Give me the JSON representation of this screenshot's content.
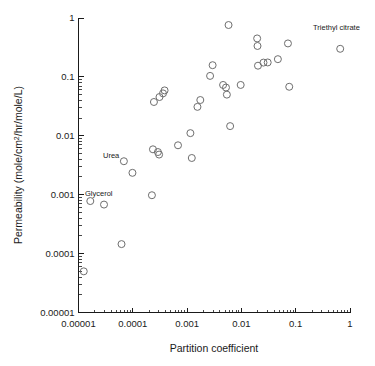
{
  "chart_data": {
    "type": "scatter",
    "title": "",
    "xlabel": "Partition coefficient",
    "ylabel": "Permeability (mole/cm2/hr/mole/L)",
    "ylabel_parts": {
      "pre": "Permeability (mole/cm",
      "sup": "2",
      "post": "/hr/mole/L)"
    },
    "xscale": "log",
    "yscale": "log",
    "xlim": [
      1e-05,
      1
    ],
    "ylim": [
      1e-05,
      1
    ],
    "grid": false,
    "legend": null,
    "xticks": [
      "0.00001",
      "0.0001",
      "0.001",
      "0.01",
      "0.1",
      "1"
    ],
    "xtick_values": [
      1e-05,
      0.0001,
      0.001,
      0.01,
      0.1,
      1
    ],
    "yticks": [
      "0.00001",
      "0.0001",
      "0.001",
      "0.01",
      "0.1",
      "1"
    ],
    "ytick_values": [
      1e-05,
      0.0001,
      0.001,
      0.01,
      0.1,
      1
    ],
    "marker": "open-circle",
    "marker_color": "#6e6e6e",
    "points": [
      {
        "x": 1.25e-05,
        "y": 5e-05,
        "label": null
      },
      {
        "x": 1.65e-05,
        "y": 0.00078,
        "label": "Glycerol"
      },
      {
        "x": 2.95e-05,
        "y": 0.00068,
        "label": null
      },
      {
        "x": 6.2e-05,
        "y": 0.000145,
        "label": null
      },
      {
        "x": 6.85e-05,
        "y": 0.0037,
        "label": "Urea"
      },
      {
        "x": 9.85e-05,
        "y": 0.00235,
        "label": null
      },
      {
        "x": 0.000225,
        "y": 0.00098,
        "label": null
      },
      {
        "x": 0.000235,
        "y": 0.0059,
        "label": null
      },
      {
        "x": 0.000245,
        "y": 0.0375,
        "label": null
      },
      {
        "x": 0.00029,
        "y": 0.0053,
        "label": null
      },
      {
        "x": 0.000305,
        "y": 0.0048,
        "label": null
      },
      {
        "x": 0.00031,
        "y": 0.0455,
        "label": null
      },
      {
        "x": 0.00036,
        "y": 0.0525,
        "label": null
      },
      {
        "x": 0.000385,
        "y": 0.059,
        "label": null
      },
      {
        "x": 0.00068,
        "y": 0.0069,
        "label": null
      },
      {
        "x": 0.00115,
        "y": 0.0111,
        "label": null
      },
      {
        "x": 0.00122,
        "y": 0.0042,
        "label": null
      },
      {
        "x": 0.00155,
        "y": 0.031,
        "label": null
      },
      {
        "x": 0.00175,
        "y": 0.0405,
        "label": null
      },
      {
        "x": 0.00265,
        "y": 0.104,
        "label": null
      },
      {
        "x": 0.00295,
        "y": 0.158,
        "label": null
      },
      {
        "x": 0.0046,
        "y": 0.073,
        "label": null
      },
      {
        "x": 0.0052,
        "y": 0.066,
        "label": null
      },
      {
        "x": 0.0054,
        "y": 0.05,
        "label": null
      },
      {
        "x": 0.0058,
        "y": 0.76,
        "label": null
      },
      {
        "x": 0.0062,
        "y": 0.0146,
        "label": null
      },
      {
        "x": 0.0097,
        "y": 0.073,
        "label": null
      },
      {
        "x": 0.0195,
        "y": 0.45,
        "label": null
      },
      {
        "x": 0.0198,
        "y": 0.335,
        "label": null
      },
      {
        "x": 0.0202,
        "y": 0.155,
        "label": null
      },
      {
        "x": 0.0255,
        "y": 0.175,
        "label": null
      },
      {
        "x": 0.0305,
        "y": 0.176,
        "label": null
      },
      {
        "x": 0.047,
        "y": 0.2,
        "label": null
      },
      {
        "x": 0.072,
        "y": 0.37,
        "label": null
      },
      {
        "x": 0.076,
        "y": 0.068,
        "label": null
      },
      {
        "x": 0.66,
        "y": 0.3,
        "label": "Triethyl citrate"
      }
    ],
    "annotations": [
      {
        "text": "Glycerol",
        "px": 85,
        "py": 196
      },
      {
        "text": "Urea",
        "px": 103,
        "py": 158
      },
      {
        "text": "Triethyl citrate",
        "px": 313,
        "py": 30
      }
    ]
  }
}
